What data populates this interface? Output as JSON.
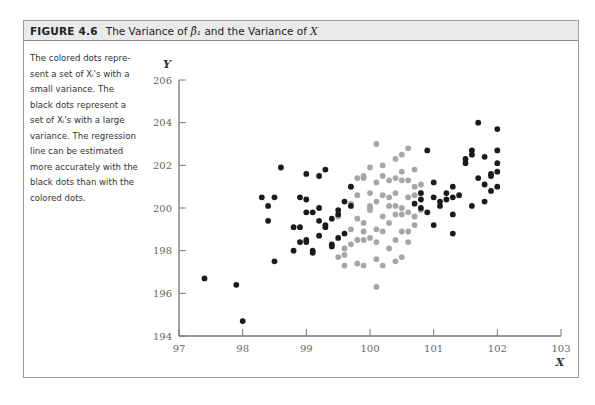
{
  "figure": {
    "number": "FIGURE 4.6",
    "title_pre": "The Variance of ",
    "title_symbol": "β̂₁",
    "title_post": " and the Variance of ",
    "title_var": "X"
  },
  "caption": {
    "lines": [
      "The colored dots repre-",
      "sent a set of Xᵢ's with a",
      "small variance. The",
      "black dots represent a",
      "set of Xᵢ's with a large",
      "variance. The regression",
      "line can be estimated",
      "more accurately with the",
      "black dots than with the",
      "colored dots."
    ]
  },
  "colors": {
    "black_dots": "#1a1a1a",
    "colored_dots": "#a6a6a6",
    "axis": "#777777",
    "header_bg": "#eaeaea"
  },
  "chart_data": {
    "type": "scatter",
    "title": "The Variance of β̂₁ and the Variance of X",
    "xlabel": "X",
    "ylabel": "Y",
    "xlim": [
      97,
      103
    ],
    "ylim": [
      194,
      206
    ],
    "xticks": [
      97,
      98,
      99,
      100,
      101,
      102,
      103
    ],
    "yticks": [
      194,
      196,
      198,
      200,
      202,
      204,
      206
    ],
    "grid": false,
    "legend": "none (described in caption)",
    "series": [
      {
        "name": "Black dots (large variance of X)",
        "color": "#1a1a1a",
        "points": [
          [
            97.4,
            196.7
          ],
          [
            97.9,
            196.4
          ],
          [
            98.0,
            194.7
          ],
          [
            98.5,
            197.5
          ],
          [
            98.4,
            200.1
          ],
          [
            98.5,
            200.5
          ],
          [
            98.6,
            201.9
          ],
          [
            98.4,
            199.4
          ],
          [
            98.8,
            198.0
          ],
          [
            98.8,
            199.1
          ],
          [
            98.9,
            199.1
          ],
          [
            98.9,
            200.5
          ],
          [
            99.0,
            198.5
          ],
          [
            99.0,
            198.4
          ],
          [
            99.0,
            199.8
          ],
          [
            99.0,
            201.6
          ],
          [
            99.1,
            197.9
          ],
          [
            99.1,
            198.0
          ],
          [
            99.1,
            199.8
          ],
          [
            99.2,
            198.7
          ],
          [
            99.2,
            199.4
          ],
          [
            99.2,
            200.0
          ],
          [
            99.2,
            201.5
          ],
          [
            99.3,
            199.1
          ],
          [
            99.3,
            199.2
          ],
          [
            99.3,
            201.8
          ],
          [
            99.4,
            198.3
          ],
          [
            99.4,
            198.2
          ],
          [
            99.4,
            199.5
          ],
          [
            99.5,
            198.6
          ],
          [
            99.5,
            199.7
          ],
          [
            99.5,
            199.9
          ],
          [
            99.6,
            198.8
          ],
          [
            99.7,
            201.0
          ],
          [
            99.7,
            200.1
          ],
          [
            99.6,
            200.3
          ],
          [
            98.3,
            200.5
          ],
          [
            98.9,
            198.4
          ],
          [
            99.0,
            200.4
          ],
          [
            100.7,
            200.2
          ],
          [
            100.8,
            200.7
          ],
          [
            100.8,
            200.4
          ],
          [
            100.8,
            200.0
          ],
          [
            100.9,
            199.8
          ],
          [
            100.9,
            202.7
          ],
          [
            101.0,
            201.2
          ],
          [
            101.0,
            200.5
          ],
          [
            101.0,
            199.2
          ],
          [
            101.1,
            200.3
          ],
          [
            101.1,
            200.1
          ],
          [
            101.2,
            200.7
          ],
          [
            101.2,
            200.4
          ],
          [
            101.3,
            199.7
          ],
          [
            101.3,
            201.0
          ],
          [
            101.3,
            200.5
          ],
          [
            101.5,
            202.1
          ],
          [
            101.4,
            200.6
          ],
          [
            101.3,
            198.8
          ],
          [
            101.6,
            202.7
          ],
          [
            101.6,
            202.5
          ],
          [
            101.6,
            200.1
          ],
          [
            101.5,
            202.3
          ],
          [
            101.7,
            201.4
          ],
          [
            101.8,
            202.4
          ],
          [
            101.8,
            200.3
          ],
          [
            101.9,
            201.5
          ],
          [
            101.8,
            201.1
          ],
          [
            101.9,
            201.6
          ],
          [
            101.9,
            200.8
          ],
          [
            102.0,
            201.7
          ],
          [
            101.7,
            204.0
          ],
          [
            102.0,
            203.7
          ],
          [
            102.0,
            202.7
          ],
          [
            102.0,
            202.1
          ],
          [
            102.0,
            201.0
          ]
        ]
      },
      {
        "name": "Colored dots (small variance of X)",
        "color": "#a6a6a6",
        "points": [
          [
            99.5,
            197.7
          ],
          [
            99.5,
            199.6
          ],
          [
            99.6,
            198.1
          ],
          [
            99.6,
            197.3
          ],
          [
            99.6,
            197.8
          ],
          [
            99.7,
            200.2
          ],
          [
            99.7,
            199.0
          ],
          [
            99.7,
            201.0
          ],
          [
            99.8,
            199.5
          ],
          [
            99.8,
            200.6
          ],
          [
            99.8,
            198.5
          ],
          [
            99.8,
            197.4
          ],
          [
            99.9,
            199.3
          ],
          [
            99.9,
            201.4
          ],
          [
            99.9,
            201.5
          ],
          [
            99.9,
            198.5
          ],
          [
            99.9,
            197.3
          ],
          [
            100.0,
            200.1
          ],
          [
            100.0,
            200.0
          ],
          [
            100.0,
            198.6
          ],
          [
            100.0,
            199.9
          ],
          [
            100.1,
            200.3
          ],
          [
            100.1,
            199.0
          ],
          [
            100.1,
            201.2
          ],
          [
            100.1,
            197.6
          ],
          [
            100.1,
            196.3
          ],
          [
            100.1,
            203.0
          ],
          [
            100.2,
            200.6
          ],
          [
            100.2,
            199.6
          ],
          [
            100.2,
            198.9
          ],
          [
            100.2,
            201.5
          ],
          [
            100.2,
            202.0
          ],
          [
            100.3,
            200.1
          ],
          [
            100.3,
            198.1
          ],
          [
            100.3,
            201.3
          ],
          [
            100.3,
            199.3
          ],
          [
            100.4,
            200.1
          ],
          [
            100.4,
            199.7
          ],
          [
            100.4,
            201.4
          ],
          [
            100.4,
            198.5
          ],
          [
            100.4,
            200.7
          ],
          [
            100.5,
            199.7
          ],
          [
            100.5,
            197.7
          ],
          [
            100.5,
            201.3
          ],
          [
            100.5,
            202.5
          ],
          [
            100.5,
            200.0
          ],
          [
            100.6,
            199.8
          ],
          [
            100.6,
            198.4
          ],
          [
            100.6,
            202.8
          ],
          [
            100.6,
            200.5
          ],
          [
            100.6,
            198.9
          ],
          [
            100.7,
            200.6
          ],
          [
            100.7,
            199.2
          ],
          [
            100.7,
            199.6
          ],
          [
            100.7,
            201.0
          ],
          [
            100.8,
            201.1
          ],
          [
            100.8,
            200.7
          ],
          [
            100.8,
            199.9
          ],
          [
            100.7,
            201.8
          ],
          [
            100.6,
            201.3
          ],
          [
            100.5,
            198.9
          ],
          [
            100.0,
            200.7
          ],
          [
            99.9,
            198.9
          ],
          [
            99.7,
            198.3
          ],
          [
            100.1,
            198.4
          ],
          [
            100.3,
            200.5
          ],
          [
            100.2,
            197.3
          ],
          [
            100.4,
            197.5
          ],
          [
            99.8,
            201.4
          ],
          [
            100.0,
            201.9
          ],
          [
            100.5,
            201.7
          ],
          [
            100.4,
            202.3
          ]
        ]
      }
    ]
  }
}
